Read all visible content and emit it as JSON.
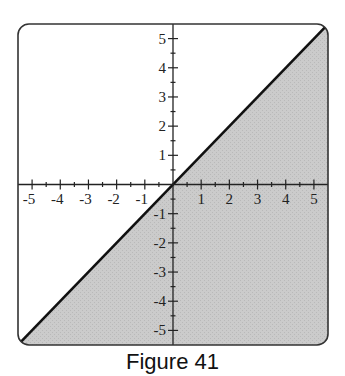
{
  "caption": "Figure 41",
  "colors": {
    "shade": "#c9c9c9",
    "line": "#111111",
    "frame": "#333333",
    "axis": "#222222"
  },
  "chart_data": {
    "type": "area",
    "title": "Figure 41",
    "boundary_line": {
      "equation": "y = x",
      "style": "solid",
      "points": [
        [
          -5.5,
          -5.5
        ],
        [
          5.5,
          5.5
        ]
      ]
    },
    "shaded_region": "y <= x",
    "xlabel": "",
    "ylabel": "",
    "xlim": [
      -5.5,
      5.5
    ],
    "ylim": [
      -5.5,
      5.5
    ],
    "x_ticks": [
      -5,
      -4,
      -3,
      -2,
      -1,
      1,
      2,
      3,
      4,
      5
    ],
    "y_ticks": [
      -5,
      -4,
      -3,
      -2,
      -1,
      1,
      2,
      3,
      4,
      5
    ],
    "x_tick_labels": [
      "-5",
      "-4",
      "-3",
      "-2",
      "-1",
      "1",
      "2",
      "3",
      "4",
      "5"
    ],
    "y_tick_labels": [
      "-5",
      "-4",
      "-3",
      "-2",
      "-1",
      "1",
      "2",
      "3",
      "4",
      "5"
    ],
    "minor_ticks": 0.5,
    "grid": false,
    "legend": null
  }
}
